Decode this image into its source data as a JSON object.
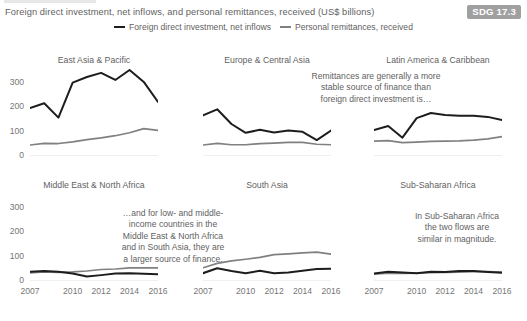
{
  "figure": {
    "title": "Foreign direct investment, net inflows, and personal remittances, received (US$ billions)",
    "badge": "SDG 17.3",
    "badge_color": "#a0a0a0",
    "text_color": "#5f5f5f"
  },
  "legend": {
    "position": "top-center",
    "items": [
      {
        "label": "Foreign direct investment, net inflows",
        "color": "#1d1d1d",
        "icon": "line-swatch-icon"
      },
      {
        "label": "Personal remittances, received",
        "color": "#808080",
        "icon": "line-swatch-icon"
      }
    ]
  },
  "axes": {
    "yticks": [
      "300",
      "200",
      "100",
      "0"
    ],
    "ytick_values": [
      300,
      200,
      100,
      0
    ],
    "ylim": [
      0,
      360
    ],
    "xticks": [
      "2007",
      "2010",
      "2012",
      "2014",
      "2016"
    ],
    "xtick_values": [
      2007,
      2010,
      2012,
      2014,
      2016
    ],
    "xlim": [
      2007,
      2016
    ],
    "grid": false
  },
  "annotations": [
    {
      "id": "annotation-remittances-stable",
      "text": "Remittances are generally a more\nstable source of finance than\nforeign direct investment is…"
    },
    {
      "id": "annotation-low-middle-income",
      "text": "…and for low- and middle-\nincome countries in the\nMiddle East & North Africa\nand in South Asia, they are\na larger source of finance."
    },
    {
      "id": "annotation-ssa-similar",
      "text": "In Sub-Saharan Africa\nthe two flows are\nsimilar in magnitude."
    }
  ],
  "chart_data": {
    "type": "line",
    "title": "Foreign direct investment, net inflows, and personal remittances, received (US$ billions)",
    "xlabel": "",
    "ylabel": "US$ billions",
    "ylim": [
      0,
      360
    ],
    "xlim": [
      2007,
      2016
    ],
    "grid": false,
    "legend_position": "top-center",
    "x": [
      2007,
      2008,
      2009,
      2010,
      2011,
      2012,
      2013,
      2014,
      2015,
      2016
    ],
    "panels": [
      {
        "name": "East Asia & Pacific",
        "series": [
          {
            "name": "Foreign direct investment, net inflows",
            "color": "#1d1d1d",
            "values": [
              196,
              216,
              157,
              300,
              323,
              340,
              311,
              352,
              303,
              221
            ]
          },
          {
            "name": "Personal remittances, received",
            "color": "#808080",
            "values": [
              45,
              52,
              51,
              58,
              67,
              74,
              83,
              95,
              112,
              105
            ]
          }
        ]
      },
      {
        "name": "Europe & Central Asia",
        "series": [
          {
            "name": "Foreign direct investment, net inflows",
            "color": "#1d1d1d",
            "values": [
              166,
              191,
              131,
              95,
              107,
              96,
              104,
              99,
              65,
              104
            ]
          },
          {
            "name": "Personal remittances, received",
            "color": "#808080",
            "values": [
              45,
              52,
              46,
              46,
              51,
              53,
              56,
              56,
              48,
              46
            ]
          }
        ]
      },
      {
        "name": "Latin America & Caribbean",
        "series": [
          {
            "name": "Foreign direct investment, net inflows",
            "color": "#1d1d1d",
            "values": [
              106,
              123,
              75,
              155,
              176,
              168,
              165,
              165,
              160,
              147
            ]
          },
          {
            "name": "Personal remittances, received",
            "color": "#808080",
            "values": [
              61,
              63,
              55,
              57,
              60,
              61,
              62,
              65,
              70,
              79
            ]
          }
        ]
      },
      {
        "name": "Middle East & North Africa",
        "series": [
          {
            "name": "Foreign direct investment, net inflows",
            "color": "#1d1d1d",
            "values": [
              38,
              41,
              38,
              31,
              18,
              24,
              31,
              32,
              30,
              28
            ]
          },
          {
            "name": "Personal remittances, received",
            "color": "#808080",
            "values": [
              33,
              37,
              35,
              37,
              41,
              47,
              49,
              54,
              54,
              54
            ]
          }
        ]
      },
      {
        "name": "South Asia",
        "series": [
          {
            "name": "Foreign direct investment, net inflows",
            "color": "#1d1d1d",
            "values": [
              32,
              52,
              41,
              32,
              42,
              32,
              35,
              42,
              49,
              50
            ]
          },
          {
            "name": "Personal remittances, received",
            "color": "#808080",
            "values": [
              54,
              72,
              82,
              89,
              97,
              108,
              111,
              115,
              118,
              110
            ]
          }
        ]
      },
      {
        "name": "Sub-Saharan Africa",
        "series": [
          {
            "name": "Foreign direct investment, net inflows",
            "color": "#1d1d1d",
            "values": [
              31,
              38,
              35,
              32,
              38,
              37,
              41,
              41,
              37,
              34
            ]
          },
          {
            "name": "Personal remittances, received",
            "color": "#808080",
            "values": [
              28,
              32,
              31,
              32,
              34,
              35,
              36,
              38,
              38,
              36
            ]
          }
        ]
      }
    ]
  }
}
